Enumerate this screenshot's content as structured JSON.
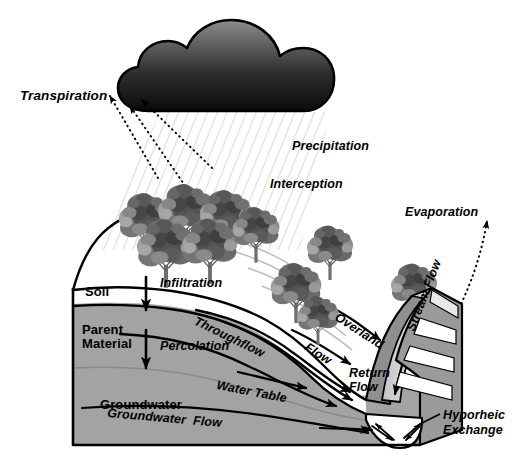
{
  "figure": {
    "background_color": "#ffffff"
  },
  "palette": {
    "outline": "#000000",
    "parent_material_fill": "#a3a3a3",
    "soil_fill": "#ffffff",
    "stream_water_fill": "#d2d2d2",
    "stream_bank_fill": "#8f8f8f",
    "block_side_fill": "#9a9a9a",
    "block_face_fill": "#c9c9c9",
    "precip_hatch": "#d9d9d9",
    "cloud_top": "#8a8a8a",
    "cloud_bottom": "#0d0d0d",
    "tree_dark": "#4a4a4a",
    "tree_mid": "#7d7d7d",
    "tree_light": "#b4b4b4",
    "trunk": "#6b6b6b"
  },
  "labels": {
    "transpiration": "Transpiration",
    "precipitation": "Precipitation",
    "interception": "Interception",
    "evaporation": "Evaporation",
    "soil": "Soil",
    "parent_material_line1": "Parent",
    "parent_material_line2": "Material",
    "groundwater": "Groundwater",
    "infiltration": "Infiltration",
    "percolation": "Percolation",
    "throughflow": "Throughflow",
    "water_table": "Water Table",
    "groundwater_flow": "Groundwater  Flow",
    "overland": "Overland",
    "overland_flow_second": "Flow",
    "return_flow_line1": "Return",
    "return_flow_line2": "Flow",
    "stream_flow": "Stream Flow",
    "hyporheic_line1": "Hyporheic",
    "hyporheic_line2": "Exchange"
  },
  "processes": [
    {
      "name": "transpiration",
      "label": "Transpiration",
      "style": "dotted-arrow",
      "direction": "upward-left"
    },
    {
      "name": "precipitation",
      "label": "Precipitation",
      "style": "hatched-fall",
      "direction": "downward"
    },
    {
      "name": "interception",
      "label": "Interception",
      "style": "canopy",
      "direction": "none"
    },
    {
      "name": "evaporation",
      "label": "Evaporation",
      "style": "dotted-arrow",
      "direction": "upward-right"
    },
    {
      "name": "infiltration",
      "label": "Infiltration",
      "style": "solid-arrow",
      "direction": "downward"
    },
    {
      "name": "percolation",
      "label": "Percolation",
      "style": "solid-arrow",
      "direction": "downward"
    },
    {
      "name": "throughflow",
      "label": "Throughflow",
      "style": "curved-arrow",
      "direction": "downslope"
    },
    {
      "name": "overland-flow",
      "label": "Overland Flow",
      "style": "curved-arrow",
      "direction": "downslope"
    },
    {
      "name": "return-flow",
      "label": "Return Flow",
      "style": "curved-arrow",
      "direction": "to-stream"
    },
    {
      "name": "stream-flow",
      "label": "Stream Flow",
      "style": "channel-arrow",
      "direction": "down-channel"
    },
    {
      "name": "groundwater-flow",
      "label": "Groundwater Flow",
      "style": "solid-arrow",
      "direction": "to-stream"
    },
    {
      "name": "hyporheic-exchange",
      "label": "Hyporheic Exchange",
      "style": "crossing-arrows",
      "direction": "bidirectional"
    },
    {
      "name": "water-table",
      "label": "Water Table",
      "style": "boundary-line",
      "direction": "none"
    }
  ],
  "strata": [
    {
      "name": "soil",
      "label": "Soil",
      "fill": "#ffffff"
    },
    {
      "name": "parent-material",
      "label": "Parent Material",
      "fill": "#a3a3a3"
    },
    {
      "name": "groundwater",
      "label": "Groundwater",
      "fill": "#a3a3a3"
    }
  ]
}
